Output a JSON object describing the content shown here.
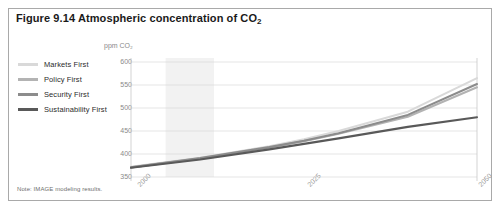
{
  "figure": {
    "title_prefix": "Figure 9.14 Atmospheric concentration of CO",
    "title_subscript": "2",
    "note": "Note: IMAGE modeling results."
  },
  "legend": {
    "items": [
      {
        "label": "Markets First",
        "color": "#d9d9d9"
      },
      {
        "label": "Policy First",
        "color": "#b3b3b3"
      },
      {
        "label": "Security First",
        "color": "#8c8c8c"
      },
      {
        "label": "Sustainability First",
        "color": "#595959"
      }
    ]
  },
  "chart_data": {
    "type": "line",
    "title": "Figure 9.14 Atmospheric concentration of CO2",
    "xlabel": "",
    "ylabel": "ppm CO2",
    "ylim": [
      350,
      600
    ],
    "xlim": [
      2000,
      2050
    ],
    "yticks": [
      600,
      550,
      500,
      450,
      400,
      350
    ],
    "xticks": [
      2000,
      2025,
      2050
    ],
    "grid": true,
    "legend_position": "left-outside",
    "shaded_band": {
      "x_start": 2005,
      "x_end": 2012,
      "color": "#f2f2f2"
    },
    "x": [
      2000,
      2010,
      2020,
      2025,
      2030,
      2040,
      2050
    ],
    "series": [
      {
        "name": "Markets First",
        "color": "#d9d9d9",
        "values": [
          372,
          392,
          417,
          432,
          450,
          492,
          565
        ]
      },
      {
        "name": "Policy First",
        "color": "#b3b3b3",
        "values": [
          371,
          390,
          414,
          428,
          444,
          481,
          545
        ]
      },
      {
        "name": "Security First",
        "color": "#8c8c8c",
        "values": [
          371,
          391,
          415,
          429,
          445,
          485,
          552
        ]
      },
      {
        "name": "Sustainability First",
        "color": "#595959",
        "values": [
          370,
          388,
          410,
          422,
          434,
          459,
          480
        ]
      }
    ]
  },
  "axis": {
    "unit_label": "ppm CO₂",
    "ytick_labels": [
      "600",
      "550",
      "500",
      "450",
      "400",
      "350"
    ],
    "xtick_labels": [
      "2000",
      "2025",
      "2050"
    ]
  }
}
